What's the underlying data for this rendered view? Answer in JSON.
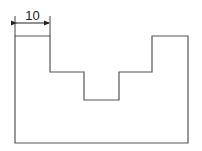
{
  "diagram": {
    "type": "technical-drawing",
    "shape": "stepped-U-profile",
    "outline_points": [
      [
        15,
        36
      ],
      [
        50,
        36
      ],
      [
        50,
        72
      ],
      [
        84,
        72
      ],
      [
        84,
        100
      ],
      [
        119,
        100
      ],
      [
        119,
        72
      ],
      [
        152,
        72
      ],
      [
        152,
        36
      ],
      [
        188,
        36
      ],
      [
        188,
        143
      ],
      [
        15,
        143
      ]
    ],
    "line_color": "#555555",
    "dimension": {
      "label": "10",
      "from_x": 15,
      "to_x": 50,
      "y": 23
    }
  }
}
